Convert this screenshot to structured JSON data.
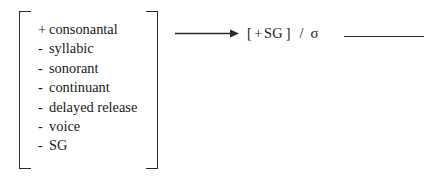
{
  "diagram": {
    "type": "phonological-rule",
    "input_matrix": {
      "features": [
        {
          "sign": "+",
          "name": "consonantal"
        },
        {
          "sign": "-",
          "name": "syllabic"
        },
        {
          "sign": "-",
          "name": "sonorant"
        },
        {
          "sign": "-",
          "name": "continuant"
        },
        {
          "sign": "-",
          "name": "delayed release"
        },
        {
          "sign": "-",
          "name": "voice"
        },
        {
          "sign": "-",
          "name": "SG"
        }
      ]
    },
    "arrow": {
      "glyph": "→",
      "meaning": "becomes"
    },
    "output": {
      "bracket_open": "[",
      "sign": "+",
      "feature": "SG",
      "bracket_close": "]",
      "environment_slash": "/",
      "environment_domain": "σ",
      "environment_blank": ""
    },
    "colors": {
      "ink": "#1a1a1a",
      "rule_line": "#2b2b2b",
      "background": "#ffffff"
    }
  }
}
